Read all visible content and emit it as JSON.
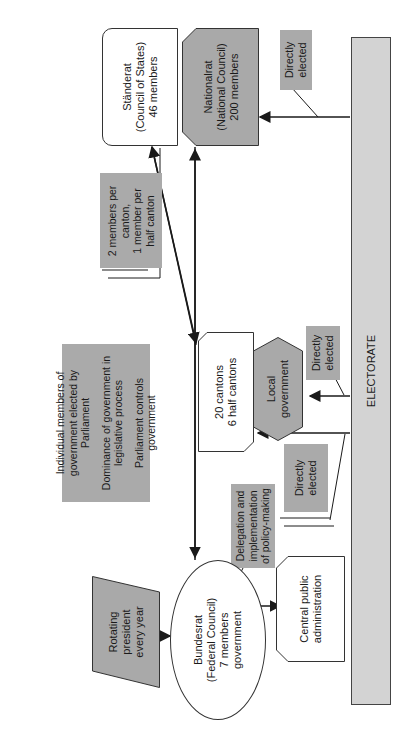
{
  "diagram": {
    "orientation": "rotated-90-ccw",
    "electorate": {
      "label": "ELECTORATE"
    },
    "staenderat": {
      "label": "Ständerat\n(Council of States)\n46 members",
      "lines": [
        "Ständerat",
        "(Council of States)",
        "46 members"
      ]
    },
    "nationalrat": {
      "lines": [
        "Nationalrat",
        "(National Council)",
        "200 members"
      ]
    },
    "nationalrat_note": {
      "lines": [
        "Directly",
        "elected"
      ]
    },
    "staenderat_note": {
      "lines": [
        "2 members per",
        "canton,",
        "1 member per",
        "half canton"
      ]
    },
    "parliament_note": {
      "paragraphs": [
        [
          "Individual members of",
          "government elected by",
          "Parliament"
        ],
        [
          "Dominance of government in",
          "legislative process"
        ],
        [
          "Parliament controls",
          "government"
        ]
      ]
    },
    "cantons": {
      "lines": [
        "20 cantons",
        "6 half cantons"
      ]
    },
    "local_government": {
      "lines": [
        "Local",
        "government"
      ]
    },
    "local_note": {
      "lines": [
        "Directly",
        "elected"
      ]
    },
    "cantons_note": {
      "lines": [
        "Directly",
        "elected"
      ]
    },
    "delegation_note": {
      "lines": [
        "Delegation and",
        "implementation",
        "of policy-making"
      ]
    },
    "central_admin": {
      "lines": [
        "Central public",
        "administration"
      ]
    },
    "bundesrat": {
      "lines": [
        "Bundesrat",
        "(Federal Council)",
        "7 members",
        "government"
      ]
    },
    "president_note": {
      "lines": [
        "Rotating",
        "president",
        "every year"
      ]
    },
    "colors": {
      "grey_box": "#a9a9a9",
      "note_grey": "#aaaaaa",
      "electorate": "#d3d3d3",
      "line": "#1a1a1a"
    }
  }
}
